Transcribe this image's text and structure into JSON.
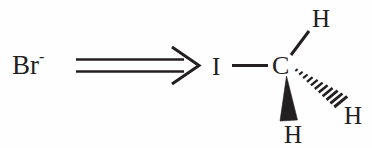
{
  "diagram": {
    "background_color": "#fefefe",
    "ink_color": "#231f20",
    "reactant": {
      "name": "bromide-ion",
      "symbol": "Br",
      "charge": "-"
    },
    "operator": {
      "name": "implies-arrow",
      "glyph": "⟹",
      "style": "double-line-open-arrowhead",
      "direction": "right"
    },
    "molecule": {
      "name": "iodomethane",
      "central_atom": "C",
      "substituents": [
        {
          "label": "I",
          "bond": "plain",
          "position": "left"
        },
        {
          "label": "H",
          "bond": "plain",
          "position": "up-right"
        },
        {
          "label": "H",
          "bond": "solid-wedge",
          "position": "down"
        },
        {
          "label": "H",
          "bond": "hashed-wedge",
          "position": "down-right"
        }
      ],
      "hash_count": 11
    }
  }
}
